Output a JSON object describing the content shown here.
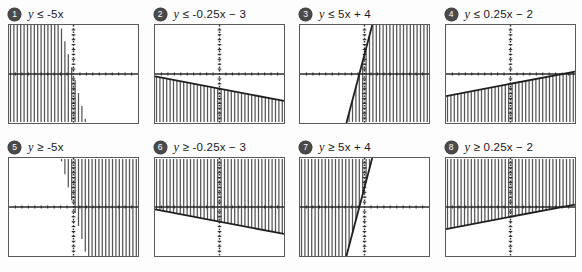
{
  "page": {
    "background": "#fdfdfd",
    "badge_color": "#4a4a4a",
    "line_color": "#1f1f1f",
    "axis_color": "#2b2b2b",
    "shade_color": "#555555",
    "panel_border": "#5a5a5a"
  },
  "items": [
    {
      "number": "1",
      "label": "y ≤ -5x",
      "relation": "≤",
      "expression": "-5x",
      "slope": -5,
      "intercept": 0,
      "shade": "below",
      "boundary": "solid"
    },
    {
      "number": "2",
      "label": "y ≤ -0.25x − 3",
      "relation": "≤",
      "expression": "-0.25x − 3",
      "slope": -0.25,
      "intercept": -3,
      "shade": "below",
      "boundary": "solid"
    },
    {
      "number": "3",
      "label": "y ≤ 5x + 4",
      "relation": "≤",
      "expression": "5x + 4",
      "slope": 5,
      "intercept": 4,
      "shade": "below",
      "boundary": "solid"
    },
    {
      "number": "4",
      "label": "y ≤ 0.25x − 2",
      "relation": "≤",
      "expression": "0.25x − 2",
      "slope": 0.25,
      "intercept": -2,
      "shade": "below",
      "boundary": "solid"
    },
    {
      "number": "5",
      "label": "y ≥ -5x",
      "relation": "≥",
      "expression": "-5x",
      "slope": -5,
      "intercept": 0,
      "shade": "above",
      "boundary": "solid"
    },
    {
      "number": "6",
      "label": "y ≥ -0.25x − 3",
      "relation": "≥",
      "expression": "-0.25x − 3",
      "slope": -0.25,
      "intercept": -3,
      "shade": "above",
      "boundary": "solid"
    },
    {
      "number": "7",
      "label": "y ≥ 5x + 4",
      "relation": "≥",
      "expression": "5x + 4",
      "slope": 5,
      "intercept": 4,
      "shade": "above",
      "boundary": "solid"
    },
    {
      "number": "8",
      "label": "y ≥ 0.25x − 2",
      "relation": "≥",
      "expression": "0.25x − 2",
      "slope": 0.25,
      "intercept": -2,
      "shade": "above",
      "boundary": "solid"
    }
  ],
  "chart_data": {
    "type": "line",
    "xlabel": "x",
    "ylabel": "y",
    "xlim": [
      -10,
      10
    ],
    "ylim": [
      -10,
      10
    ],
    "grid": false,
    "legend": "none",
    "tick_style": "dotted-ticks-on-axes",
    "series": [
      {
        "name": "y ≤ -5x",
        "slope": -5,
        "intercept": 0,
        "shade": "below",
        "boundary": "solid"
      },
      {
        "name": "y ≤ -0.25x − 3",
        "slope": -0.25,
        "intercept": -3,
        "shade": "below",
        "boundary": "solid"
      },
      {
        "name": "y ≤ 5x + 4",
        "slope": 5,
        "intercept": 4,
        "shade": "below",
        "boundary": "solid"
      },
      {
        "name": "y ≤ 0.25x − 2",
        "slope": 0.25,
        "intercept": -2,
        "shade": "below",
        "boundary": "solid"
      },
      {
        "name": "y ≥ -5x",
        "slope": -5,
        "intercept": 0,
        "shade": "above",
        "boundary": "solid"
      },
      {
        "name": "y ≥ -0.25x − 3",
        "slope": -0.25,
        "intercept": -3,
        "shade": "above",
        "boundary": "solid"
      },
      {
        "name": "y ≥ 5x + 4",
        "slope": 5,
        "intercept": 4,
        "shade": "above",
        "boundary": "solid"
      },
      {
        "name": "y ≥ 0.25x − 2",
        "slope": 0.25,
        "intercept": -2,
        "shade": "above",
        "boundary": "solid"
      }
    ]
  }
}
